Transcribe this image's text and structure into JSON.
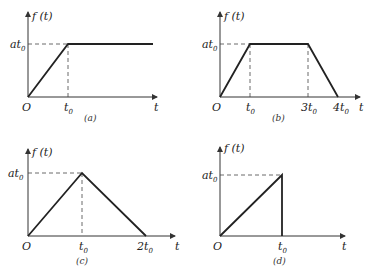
{
  "figure": {
    "panels": [
      {
        "id": "a",
        "caption": "(a)",
        "y_axis_label": "f (t)",
        "x_axis_label": "t",
        "origin_label": "O",
        "y_tick": {
          "main": "at",
          "sub": "0"
        },
        "x_ticks": [
          {
            "main": "t",
            "sub": "0"
          }
        ],
        "description": "Ramp from 0 to at0 over [0, t0], then constant at0"
      },
      {
        "id": "b",
        "caption": "(b)",
        "y_axis_label": "f (t)",
        "x_axis_label": "t",
        "origin_label": "O",
        "y_tick": {
          "main": "at",
          "sub": "0"
        },
        "x_ticks": [
          {
            "main": "t",
            "sub": "0"
          },
          {
            "main": "3t",
            "sub": "0"
          },
          {
            "main": "4t",
            "sub": "0"
          }
        ],
        "description": "Trapezoid: rise to at0 at t0, flat until 3t0, fall to 0 at 4t0"
      },
      {
        "id": "c",
        "caption": "(c)",
        "y_axis_label": "f (t)",
        "x_axis_label": "t",
        "origin_label": "O",
        "y_tick": {
          "main": "at",
          "sub": "0"
        },
        "x_ticks": [
          {
            "main": "t",
            "sub": "0"
          },
          {
            "main": "2t",
            "sub": "0"
          }
        ],
        "description": "Triangle: rise to at0 at t0, fall to 0 at 2t0"
      },
      {
        "id": "d",
        "caption": "(d)",
        "y_axis_label": "f (t)",
        "x_axis_label": "t",
        "origin_label": "O",
        "y_tick": {
          "main": "at",
          "sub": "0"
        },
        "x_ticks": [
          {
            "main": "t",
            "sub": "0"
          }
        ],
        "description": "Ramp to at0 at t0, then drop vertically to 0"
      }
    ]
  }
}
